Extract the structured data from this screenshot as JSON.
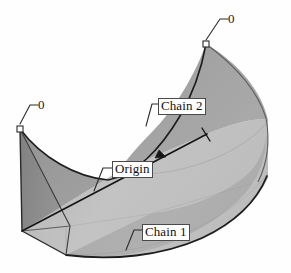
{
  "figure": {
    "type": "3d-lofted-surface-diagram",
    "width": 291,
    "height": 273,
    "background_color": "#fefefe"
  },
  "labels": {
    "chain2": "Chain 2",
    "origin": "Origin",
    "chain1": "Chain 1",
    "zero_right": "0",
    "zero_left": "0"
  },
  "colors": {
    "outline": "#1d1d1d",
    "face_left_dark": "#8a8a8a",
    "face_mid": "#9a9a9a",
    "face_upper_right": "#a3a3a3",
    "face_lower_light": "#b7b7b7",
    "face_bottom_light": "#c2c2c2",
    "marker_fill": "#ffffff",
    "marker_stroke": "#2a2a2a",
    "leader_line": "#2b2b2b",
    "label_border": "#4a4a4a",
    "label_text": "#111111"
  },
  "markers": {
    "chain2_start": {
      "x": 20,
      "y": 129,
      "shape": "square",
      "label": "0"
    },
    "chain2_end": {
      "x": 206,
      "y": 44,
      "shape": "square",
      "label": "0"
    }
  },
  "geometry": {
    "origin_axis": {
      "start_x": 22,
      "start_y": 231,
      "end_x": 207,
      "end_y": 134,
      "arrow_at": 0.72,
      "tick_at_end": true
    },
    "chain2_curve": "upper boundary sweeping from left corner (20,129) dipping to (120,175) and rising to right corner (206,44)",
    "chain1_curve": "lower boundary arc from (70,255) through (170,252) to (268,175)"
  },
  "leaders": {
    "chain2": {
      "from_x": 148,
      "from_y": 123,
      "elbow_x": 152,
      "elbow_y": 104,
      "to_x": 160,
      "to_y": 104
    },
    "origin": {
      "from_x": 96,
      "from_y": 189,
      "elbow_x": 103,
      "elbow_y": 168,
      "to_x": 113,
      "to_y": 168
    },
    "chain1": {
      "from_x": 128,
      "from_y": 249,
      "elbow_x": 134,
      "elbow_y": 230,
      "to_x": 144,
      "to_y": 230
    },
    "zero_right": {
      "from_x": 206,
      "from_y": 42,
      "elbow_x": 220,
      "elbow_y": 19,
      "to_x": 228,
      "to_y": 19
    },
    "zero_left": {
      "from_x": 21,
      "from_y": 127,
      "elbow_x": 30,
      "elbow_y": 105,
      "to_x": 38,
      "to_y": 105
    }
  }
}
